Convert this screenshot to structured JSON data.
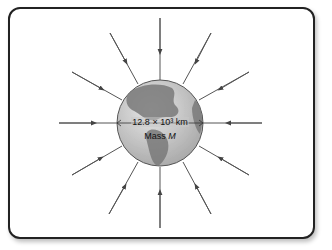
{
  "diagram": {
    "diameter_label": "12.8 × 10³ km",
    "mass_label_prefix": "Mass",
    "mass_symbol": "M",
    "field_line_count": 12,
    "colors": {
      "frame": "#222222",
      "arrow": "#555555",
      "globe_ocean": "#cfcfcf",
      "globe_land": "#7a7a7a"
    }
  }
}
